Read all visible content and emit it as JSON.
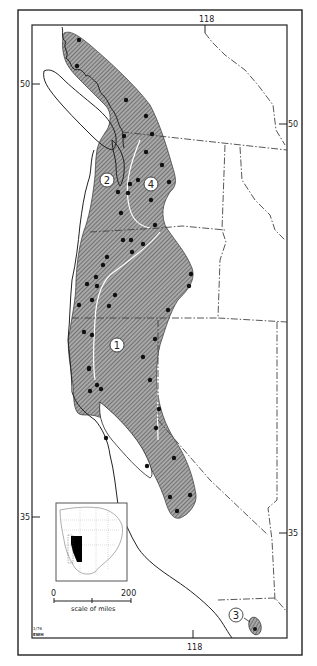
{
  "map": {
    "title": "Species range map, Pacific Northwest to Baja California",
    "colors": {
      "range_fill": "#9a9a9a",
      "range_hatch": "#3c3c3c",
      "ink": "#222222",
      "background": "#ffffff",
      "inset_range": "#000000"
    },
    "graticule": {
      "lon_top": "118",
      "lon_bottom": "118",
      "lat_50_left": "50",
      "lat_50_right": "50",
      "lat_35_left": "35",
      "lat_35_right": "35"
    },
    "range_labels": [
      "1",
      "2",
      "3",
      "4"
    ],
    "scale_bar": {
      "start": "0",
      "end": "200",
      "caption": "scale of miles"
    },
    "credit": {
      "line1": "1/76",
      "line2": "EWH"
    },
    "inset": {
      "description": "North America locator map with range shown in black"
    },
    "locality_dots_count": 58
  }
}
